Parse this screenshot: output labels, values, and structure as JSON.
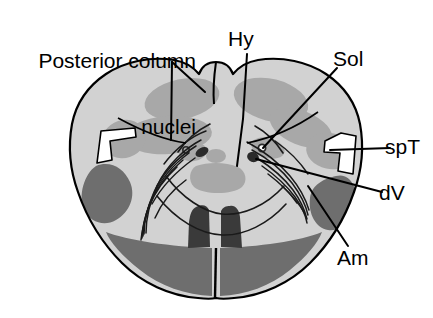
{
  "figure": {
    "name": "medulla-oblongata-cross-section"
  },
  "labels": {
    "posterior_column_nuclei": "Posterior column\nnuclei",
    "posterior_column_nuclei_line1": "Posterior column",
    "posterior_column_nuclei_line2": "nuclei",
    "hy": "Hy",
    "sol": "Sol",
    "spt": "spT",
    "dv": "dV",
    "am": "Am"
  },
  "colors": {
    "background": "#ffffff",
    "outline": "#000000",
    "white_matter": "#d2d2d2",
    "nuclei_gray": "#a8a8a8",
    "dark_gray": "#6e6e6e",
    "darkest": "#3a3a3a",
    "notch_white": "#ffffff",
    "text": "#000000"
  },
  "regions": [
    {
      "name": "gracile-cuneate-nucleus-upper-left",
      "tone": "nuclei_gray"
    },
    {
      "name": "gracile-cuneate-nucleus-lower-left",
      "tone": "nuclei_gray"
    },
    {
      "name": "gracile-cuneate-nucleus-upper-right",
      "tone": "nuclei_gray"
    },
    {
      "name": "spinal-trigeminal-nucleus-right",
      "tone": "nuclei_gray"
    },
    {
      "name": "spinal-trigeminal-tract-notch-left",
      "tone": "notch_white"
    },
    {
      "name": "spinal-trigeminal-tract-notch-right",
      "tone": "notch_white"
    },
    {
      "name": "inferior-olive-left",
      "tone": "dark_gray"
    },
    {
      "name": "inferior-olive-right",
      "tone": "dark_gray"
    },
    {
      "name": "pyramid-left",
      "tone": "dark_gray"
    },
    {
      "name": "pyramid-right",
      "tone": "dark_gray"
    },
    {
      "name": "medial-lemniscus-left",
      "tone": "darkest"
    },
    {
      "name": "medial-lemniscus-right",
      "tone": "darkest"
    },
    {
      "name": "hypoglossal-nucleus",
      "tone": "nuclei_gray"
    },
    {
      "name": "solitary-nucleus-left",
      "tone": "darkest"
    },
    {
      "name": "solitary-nucleus-right",
      "tone": "darkest"
    },
    {
      "name": "central-canal",
      "tone": "nuclei_gray"
    }
  ],
  "leaders": [
    {
      "name": "leader-posterior-column-nuclei-branch-a"
    },
    {
      "name": "leader-posterior-column-nuclei-branch-b"
    },
    {
      "name": "leader-hy"
    },
    {
      "name": "leader-sol"
    },
    {
      "name": "leader-spt"
    },
    {
      "name": "leader-dv"
    },
    {
      "name": "leader-am"
    }
  ]
}
